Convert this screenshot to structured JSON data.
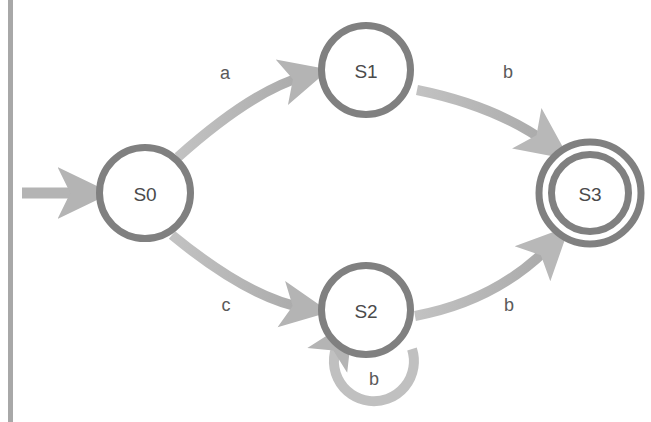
{
  "diagram": {
    "type": "finite-state-machine",
    "colors": {
      "node_stroke": "#808080",
      "node_fill": "#ffffff",
      "edge": "#b4b4b4",
      "edge_dark": "#a8a8a8",
      "label_text": "#5a5a5a",
      "node_text": "#4a4a4a",
      "margin_rule": "#a0a0a0",
      "background": "#ffffff"
    },
    "margin_rule": {
      "name": "left-margin-rule",
      "x": 10,
      "y_top": 0,
      "y_bottom": 422,
      "width": 5
    },
    "cropped_header_text": "",
    "start_arrow": {
      "label": "",
      "target": "S0",
      "x_start": 22,
      "x_end": 92,
      "y": 193
    },
    "states": [
      {
        "id": "S0",
        "label": "S0",
        "cx": 145,
        "cy": 193,
        "r": 49,
        "accepting": false,
        "initial": true
      },
      {
        "id": "S1",
        "label": "S1",
        "cx": 366,
        "cy": 70,
        "r": 48,
        "accepting": false,
        "initial": false
      },
      {
        "id": "S2",
        "label": "S2",
        "cx": 366,
        "cy": 310,
        "r": 48,
        "accepting": false,
        "initial": false
      },
      {
        "id": "S3",
        "label": "S3",
        "cx": 590,
        "cy": 193,
        "r": 44,
        "r_outer": 55,
        "accepting": true,
        "initial": false
      }
    ],
    "transitions": [
      {
        "id": "t0",
        "from": "S0",
        "to": "S1",
        "label": "a",
        "label_x": 225,
        "label_y": 73,
        "kind": "curve"
      },
      {
        "id": "t1",
        "from": "S1",
        "to": "S3",
        "label": "b",
        "label_x": 508,
        "label_y": 72,
        "kind": "curve"
      },
      {
        "id": "t2",
        "from": "S0",
        "to": "S2",
        "label": "c",
        "label_x": 226,
        "label_y": 305,
        "kind": "curve"
      },
      {
        "id": "t3",
        "from": "S2",
        "to": "S3",
        "label": "b",
        "label_x": 509,
        "label_y": 305,
        "kind": "curve"
      },
      {
        "id": "t4",
        "from": "S2",
        "to": "S2",
        "label": "b",
        "label_x": 374,
        "label_y": 379,
        "kind": "self-loop"
      }
    ]
  }
}
